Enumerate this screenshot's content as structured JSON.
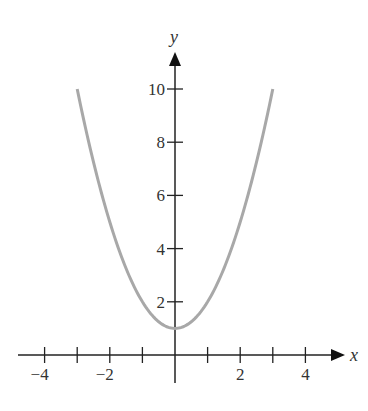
{
  "chart_data": {
    "type": "line",
    "title": "",
    "xlabel": "x",
    "ylabel": "y",
    "function": "y = x^2 + 1",
    "xlim": [
      -4.5,
      5
    ],
    "ylim": [
      0,
      11
    ],
    "x_ticks": [
      -4,
      -3,
      -2,
      -1,
      1,
      2,
      3,
      4
    ],
    "x_tick_labels": [
      "−4",
      "−2",
      "2",
      "4"
    ],
    "x_tick_label_values": [
      -4,
      -2,
      2,
      4
    ],
    "y_ticks": [
      2,
      4,
      6,
      8,
      10
    ],
    "y_tick_labels": [
      "2",
      "4",
      "6",
      "8",
      "10"
    ],
    "series": [
      {
        "name": "curve",
        "color": "#a8a8a8",
        "x": [
          -3,
          -2.5,
          -2,
          -1.5,
          -1,
          -0.5,
          0,
          0.5,
          1,
          1.5,
          2,
          2.5,
          3
        ],
        "values": [
          10,
          7.25,
          5,
          3.25,
          2,
          1.25,
          1,
          1.25,
          2,
          3.25,
          5,
          7.25,
          10
        ]
      }
    ],
    "grid": false,
    "legend": null
  }
}
